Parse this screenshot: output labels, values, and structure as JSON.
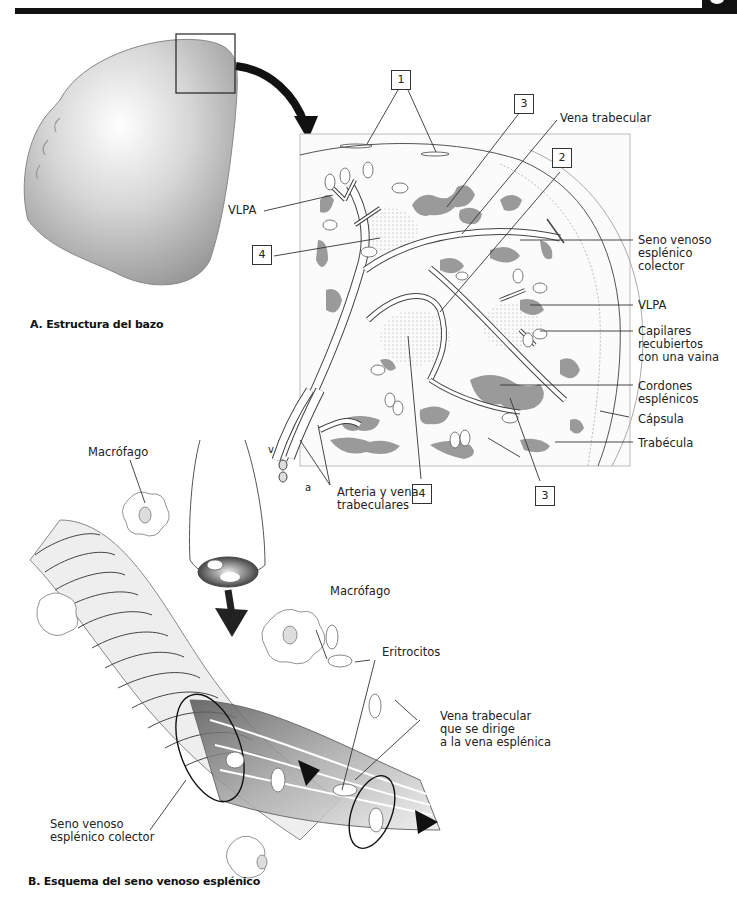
{
  "header": {
    "bar_color": "#111111"
  },
  "panel_a": {
    "caption": "A. Estructura del bazo",
    "labels": {
      "vena_trabecular": "Vena trabecular",
      "seno_venoso": "Seno venoso\nesplénico\ncolector",
      "vlpa_right": "VLPA",
      "vlpa_left": "VLPA",
      "capilares": "Capilares\nrecubiertos\ncon una vaina",
      "cordones": "Cordones\nesplénicos",
      "capsula": "Cápsula",
      "trabecula": "Trabécula",
      "arteria_vena": "Arteria y vena\ntrabeculares",
      "v": "v",
      "a": "a"
    },
    "numbered_boxes": [
      {
        "id": "box-1",
        "value": "1"
      },
      {
        "id": "box-3-top",
        "value": "3"
      },
      {
        "id": "box-2",
        "value": "2"
      },
      {
        "id": "box-4-left",
        "value": "4"
      },
      {
        "id": "box-4-bottom",
        "value": "4"
      },
      {
        "id": "box-3-bottom",
        "value": "3"
      }
    ]
  },
  "panel_b": {
    "caption": "B. Esquema del seno venoso esplénico",
    "labels": {
      "macrofago_left": "Macrófago",
      "macrofago_right": "Macrófago",
      "eritrocitos": "Eritrocitos",
      "vena_trabecular_dirige": "Vena trabecular\nque se dirige\na la vena esplénica",
      "seno_venoso_colector": "Seno venoso\nesplénico colector"
    }
  },
  "colors": {
    "red_pulp": "#8a8a8a",
    "spleen_shade": "#bdbdbd",
    "outline": "#333333"
  }
}
